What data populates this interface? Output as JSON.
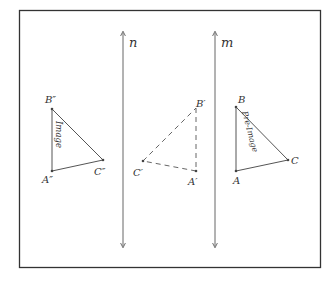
{
  "diagram": {
    "type": "geometry-reflection",
    "frame": {
      "x": 19,
      "y": 10,
      "w": 302,
      "h": 258,
      "stroke": "#333333"
    },
    "lines": [
      {
        "name": "n",
        "label": "n",
        "x": 123,
        "y1": 32,
        "y2": 247
      },
      {
        "name": "m",
        "label": "m",
        "x": 215,
        "y1": 32,
        "y2": 247
      }
    ],
    "triangles": [
      {
        "name": "image",
        "caption": "Image",
        "style": "solid",
        "vertices": {
          "A": {
            "label": "A″",
            "x": 52,
            "y": 171
          },
          "B": {
            "label": "B″",
            "x": 52,
            "y": 109
          },
          "C": {
            "label": "C″",
            "x": 103,
            "y": 160
          }
        }
      },
      {
        "name": "intermediate",
        "caption": "",
        "style": "dashed",
        "vertices": {
          "A": {
            "label": "A′",
            "x": 196,
            "y": 171
          },
          "B": {
            "label": "B′",
            "x": 196,
            "y": 108
          },
          "C": {
            "label": "C′",
            "x": 143,
            "y": 161
          }
        }
      },
      {
        "name": "pre-image",
        "caption": "Pre-Image",
        "style": "solid",
        "vertices": {
          "A": {
            "label": "A",
            "x": 236,
            "y": 171
          },
          "B": {
            "label": "B",
            "x": 236,
            "y": 107
          },
          "C": {
            "label": "C",
            "x": 288,
            "y": 160
          }
        }
      }
    ],
    "stroke_color": "#555555"
  }
}
